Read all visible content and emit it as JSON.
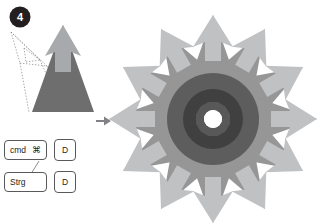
{
  "illustration": {
    "title": "Radial duplicate of an arrow shape",
    "background_color": "#ffffff",
    "step_badge": {
      "label": "4",
      "circle_color": "#231f20",
      "text_color": "#ffffff",
      "cx": 20,
      "cy": 17,
      "r": 10.5
    },
    "flow_arrow": {
      "name": "step-flow-arrow",
      "color": "#808285",
      "x": 96,
      "y": 120
    }
  },
  "source_shape": {
    "name": "Source arrow",
    "body_color": "#6e6e6e",
    "head_color": "#a7a9ac",
    "guide_color": "#808285",
    "guide_style": "dotted",
    "apex_x": 63,
    "apex_y": 25,
    "base_y": 112,
    "half_width": 31
  },
  "result_shape": {
    "name": "Radial array of arrows",
    "copies": 12,
    "angle_step_degrees": 30,
    "center_x": 213,
    "center_y": 119,
    "pivot_hole_radius": 9,
    "pivot_hole_color": "#ffffff",
    "body_color": "#6e6e6e",
    "head_color": "#a7a9ac",
    "body_opacity": 0.72,
    "head_opacity": 0.72,
    "overlap_color": "#2f2f2f",
    "outer_radius": 104
  },
  "shortcuts": {
    "label": "Duplicate shortcut",
    "rows": [
      {
        "name": "mac-duplicate-shortcut",
        "modifier_label": "cmd",
        "modifier_glyph": "⌘",
        "key_label": "D"
      },
      {
        "name": "windows-duplicate-shortcut",
        "modifier_label": "Strg",
        "modifier_glyph": "",
        "key_label": "D"
      }
    ],
    "connector_color": "#808285"
  }
}
